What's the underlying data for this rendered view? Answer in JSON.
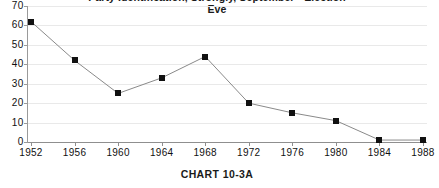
{
  "chart_data": {
    "type": "line",
    "title": "Party Identification, Strongly, September  - Election Eve",
    "title_line_1": "Party Identification, Strongly, September  -  Election",
    "title_line_2": "Eve",
    "caption": "CHART  10-3A",
    "xlabel": "",
    "ylabel": "",
    "categories": [
      "1952",
      "1956",
      "1960",
      "1964",
      "1968",
      "1972",
      "1976",
      "1980",
      "1984",
      "1988"
    ],
    "values": [
      62,
      42,
      25,
      33,
      44,
      20,
      15,
      11,
      1,
      1
    ],
    "ylim": [
      0,
      70
    ],
    "y_ticks": [
      "0",
      "10",
      "20",
      "30",
      "40",
      "50",
      "60",
      "70"
    ],
    "grid": true,
    "legend": "none",
    "marker": "square",
    "marker_color": "#111111",
    "line_color": "#8a8a8a",
    "grid_color": "#e9e9e9",
    "axis_color": "#8f8f8f"
  }
}
